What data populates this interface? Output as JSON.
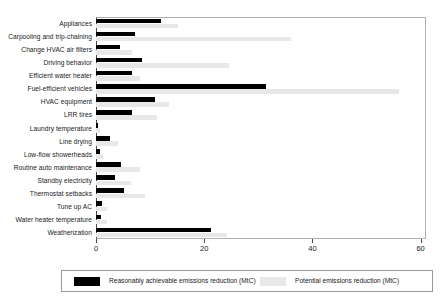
{
  "chart_data": {
    "type": "bar",
    "orientation": "horizontal",
    "title": "",
    "xlabel": "",
    "ylabel": "",
    "xlim": [
      0,
      61
    ],
    "xticks": [
      0,
      20,
      40,
      60
    ],
    "xtick_labels": [
      "0",
      "20",
      "40",
      "60"
    ],
    "grid": false,
    "legend_position": "bottom",
    "categories": [
      "Appliances",
      "Carpooling and trip-chaining",
      "Change HVAC air filters",
      "Driving behavior",
      "Efficient water heater",
      "Fuel-efficient vehicles",
      "HVAC equipment",
      "LRR tires",
      "Laundry temperature",
      "Line drying",
      "Low-flow showerheads",
      "Routine auto maintenance",
      "Standby electricity",
      "Thermostat setbacks",
      "Tune up AC",
      "Water heater temperature",
      "Weatherization"
    ],
    "series": [
      {
        "name": "Reasonably achievable emissions reduction (MtC)",
        "color": "#000000",
        "values": [
          12.0,
          7.3,
          4.4,
          8.5,
          6.6,
          31.4,
          10.9,
          6.6,
          0.4,
          2.6,
          0.7,
          4.7,
          3.6,
          5.1,
          1.1,
          1.0,
          21.2
        ]
      },
      {
        "name": "Potential emissions reduction (MtC)",
        "color": "#e8e8e8",
        "values": [
          15.2,
          36.1,
          6.6,
          24.5,
          8.1,
          56.0,
          13.5,
          11.3,
          0.7,
          4.1,
          1.3,
          8.2,
          6.4,
          9.0,
          2.0,
          2.1,
          24.2
        ]
      }
    ]
  },
  "legend": {
    "entries": [
      {
        "label": "Reasonably achievable emissions reduction (MtC)"
      },
      {
        "label": "Potential emissions reduction (MtC)"
      }
    ]
  }
}
